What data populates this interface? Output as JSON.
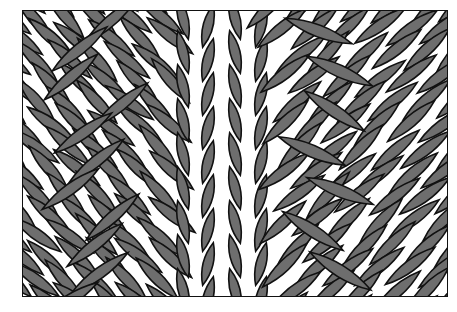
{
  "image": {
    "subject": "knitted cable stitch illustration",
    "description": "Grayscale line drawing of interlocking knit stitches: a central vertical column of V-stitches flanked by diagonal twisted cable strands",
    "colors": {
      "stitch_fill": "#6e6e6e",
      "outline": "#111111",
      "gap": "#ffffff",
      "background": "#ffffff"
    },
    "frame": {
      "x": 22,
      "y": 10,
      "width": 426,
      "height": 287
    }
  }
}
